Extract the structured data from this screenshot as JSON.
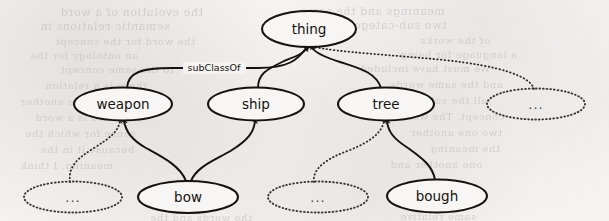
{
  "figure": {
    "type": "ontology-taxonomy-graph",
    "edge_label": "subClassOf",
    "background_color": "#f4f3f1",
    "ink_color": "#15130f",
    "ghost_color": "#b9b7b3"
  },
  "nodes": [
    {
      "id": "thing",
      "label": "thing",
      "style": "solid",
      "cx": 309,
      "cy": 29,
      "rx": 47,
      "ry": 18
    },
    {
      "id": "weapon",
      "label": "weapon",
      "style": "solid",
      "cx": 123,
      "cy": 104,
      "rx": 49,
      "ry": 16.5
    },
    {
      "id": "ship",
      "label": "ship",
      "style": "solid",
      "cx": 256,
      "cy": 104,
      "rx": 48,
      "ry": 16.5
    },
    {
      "id": "tree",
      "label": "tree",
      "style": "solid",
      "cx": 386,
      "cy": 104,
      "rx": 48,
      "ry": 16.5
    },
    {
      "id": "more-top",
      "label": "...",
      "style": "dotted",
      "cx": 536,
      "cy": 104,
      "rx": 49,
      "ry": 15.5
    },
    {
      "id": "more-weapon",
      "label": "...",
      "style": "dotted",
      "cx": 73,
      "cy": 197,
      "rx": 49,
      "ry": 15.5
    },
    {
      "id": "bow",
      "label": "bow",
      "style": "solid",
      "cx": 188,
      "cy": 197,
      "rx": 50,
      "ry": 16
    },
    {
      "id": "more-tree",
      "label": "...",
      "style": "dotted",
      "cx": 318,
      "cy": 197,
      "rx": 50,
      "ry": 15.5
    },
    {
      "id": "bough",
      "label": "bough",
      "style": "solid",
      "cx": 437,
      "cy": 196,
      "rx": 50,
      "ry": 16.5
    }
  ],
  "edges": [
    {
      "id": "weapon-thing",
      "from": "weapon",
      "to": "thing",
      "style": "solid",
      "relation": "subClassOf",
      "labeled": true
    },
    {
      "id": "ship-thing",
      "from": "ship",
      "to": "thing",
      "style": "solid",
      "relation": "subClassOf",
      "labeled": false
    },
    {
      "id": "tree-thing",
      "from": "tree",
      "to": "thing",
      "style": "solid",
      "relation": "subClassOf",
      "labeled": false
    },
    {
      "id": "more-top-thing",
      "from": "more-top",
      "to": "thing",
      "style": "dotted",
      "relation": "subClassOf",
      "labeled": false
    },
    {
      "id": "more-weapon-weapon",
      "from": "more-weapon",
      "to": "weapon",
      "style": "dotted",
      "relation": "subClassOf",
      "labeled": false
    },
    {
      "id": "bow-weapon",
      "from": "bow",
      "to": "weapon",
      "style": "solid",
      "relation": "subClassOf",
      "labeled": false
    },
    {
      "id": "bow-ship",
      "from": "bow",
      "to": "ship",
      "style": "solid",
      "relation": "subClassOf",
      "labeled": false
    },
    {
      "id": "more-tree-tree",
      "from": "more-tree",
      "to": "tree",
      "style": "dotted",
      "relation": "subClassOf",
      "labeled": false
    },
    {
      "id": "bough-tree",
      "from": "bough",
      "to": "tree",
      "style": "solid",
      "relation": "subClassOf",
      "labeled": false
    }
  ],
  "ghost_text": [
    {
      "text": "the evolution of a word",
      "x": 60,
      "y": 6,
      "size": 11
    },
    {
      "text": "meanings and the same",
      "x": 300,
      "y": 5,
      "size": 11
    },
    {
      "text": "semantic relations in",
      "x": 40,
      "y": 20,
      "size": 11
    },
    {
      "text": "two sub-categories",
      "x": 330,
      "y": 19,
      "size": 11
    },
    {
      "text": "the word for the concept",
      "x": 55,
      "y": 36,
      "size": 10
    },
    {
      "text": "of the works",
      "x": 420,
      "y": 35,
      "size": 10
    },
    {
      "text": "an ontology for the",
      "x": 30,
      "y": 50,
      "size": 10
    },
    {
      "text": "a language for being",
      "x": 400,
      "y": 49,
      "size": 10
    },
    {
      "text": "to the same concept",
      "x": 60,
      "y": 64,
      "size": 10
    },
    {
      "text": "We must have included",
      "x": 360,
      "y": 63,
      "size": 10
    },
    {
      "text": "there is a relation",
      "x": 45,
      "y": 80,
      "size": 10
    },
    {
      "text": "and the same words",
      "x": 390,
      "y": 79,
      "size": 10
    },
    {
      "text": "from one another",
      "x": 20,
      "y": 96,
      "size": 10
    },
    {
      "text": "all the subordinate",
      "x": 380,
      "y": 95,
      "size": 10
    },
    {
      "text": "the word is a word",
      "x": 35,
      "y": 112,
      "size": 10
    },
    {
      "text": "concept. The word",
      "x": 400,
      "y": 111,
      "size": 10
    },
    {
      "text": "sense for which the",
      "x": 25,
      "y": 128,
      "size": 10
    },
    {
      "text": "two one another",
      "x": 410,
      "y": 127,
      "size": 10
    },
    {
      "text": "because it in the",
      "x": 40,
      "y": 144,
      "size": 10
    },
    {
      "text": "the meaning",
      "x": 430,
      "y": 143,
      "size": 10
    },
    {
      "text": "meaning. I think",
      "x": 20,
      "y": 160,
      "size": 10
    },
    {
      "text": "one another and",
      "x": 390,
      "y": 159,
      "size": 10
    },
    {
      "text": "the words and the",
      "x": 150,
      "y": 212,
      "size": 10
    },
    {
      "text": "same relative",
      "x": 400,
      "y": 211,
      "size": 10
    }
  ]
}
